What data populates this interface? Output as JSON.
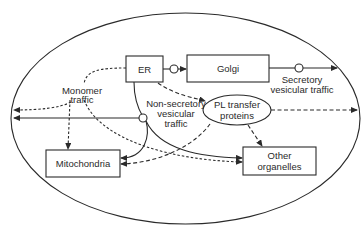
{
  "diagram": {
    "nodes": {
      "er": {
        "label": "ER"
      },
      "golgi": {
        "label": "Golgi"
      },
      "mitochondria": {
        "label": "Mitochondria"
      },
      "other": {
        "line1": "Other",
        "line2": "organelles"
      },
      "pl": {
        "line1": "PL transfer",
        "line2": "proteins"
      }
    },
    "annotations": {
      "monomer": {
        "line1": "Monomer",
        "line2": "traffic"
      },
      "nonsecretory": {
        "line1": "Non-secretory",
        "line2": "vesicular",
        "line3": "traffic"
      },
      "secretory": {
        "line1": "Secretory",
        "line2": "vesicular traffic"
      }
    },
    "colors": {
      "ink": "#2a2a2a",
      "background": "#ffffff"
    }
  }
}
